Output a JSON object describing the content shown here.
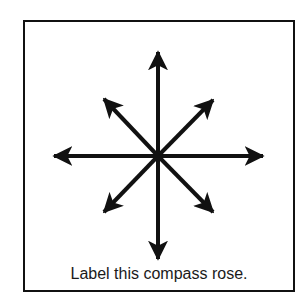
{
  "worksheet": {
    "caption": "Label this compass rose.",
    "stroke_color": "#111111",
    "background_color": "#ffffff"
  },
  "compass_rose": {
    "center": [
      158,
      156
    ],
    "arrows": [
      {
        "direction": "north",
        "tip": [
          158,
          52
        ]
      },
      {
        "direction": "northeast",
        "tip": [
          213,
          100
        ]
      },
      {
        "direction": "east",
        "tip": [
          263,
          156
        ]
      },
      {
        "direction": "southeast",
        "tip": [
          213,
          212
        ]
      },
      {
        "direction": "south",
        "tip": [
          158,
          259
        ]
      },
      {
        "direction": "southwest",
        "tip": [
          104,
          212
        ]
      },
      {
        "direction": "west",
        "tip": [
          54,
          156
        ]
      },
      {
        "direction": "northwest",
        "tip": [
          104,
          99
        ]
      }
    ]
  }
}
